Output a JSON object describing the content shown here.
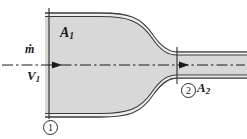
{
  "figure": {
    "name": "converging-duct-control-volume",
    "colors": {
      "fluid_fill": "#d8d8d8",
      "wall_line": "#3a3a3a",
      "wall_inner_fill": "#ebebeb",
      "centerline": "#1a1a1a",
      "label_text": "#1a1a1a",
      "background": "#ffffff"
    },
    "labels": {
      "inlet_area": "A",
      "inlet_area_sub": "1",
      "exit_area": "A",
      "exit_area_sub": "2",
      "mass_flow_rate": "ṁ",
      "inlet_velocity": "V",
      "inlet_velocity_sub": "1",
      "section_one": "1",
      "section_two": "2"
    },
    "icons": {
      "flow_arrow_inlet": "arrow-right-icon",
      "flow_arrow_exit": "arrow-right-icon",
      "centerline": "axis-centerline-icon",
      "section_marker_one": "circled-number-icon",
      "section_marker_two": "circled-number-icon"
    },
    "geometry": {
      "inlet_top_wall_y": 14,
      "inlet_bottom_wall_y": 116,
      "exit_top_wall_y": 55,
      "exit_bottom_wall_y": 75,
      "section_one_x": 49,
      "section_two_x": 177,
      "centerline_y": 65,
      "curve_start_x": 100,
      "curve_end_x": 177
    }
  }
}
